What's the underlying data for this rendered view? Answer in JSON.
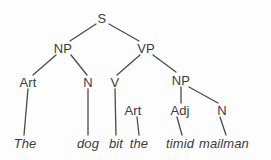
{
  "figure": {
    "kind": "syntax-parse-tree",
    "sentence": "The dog bit the timid mailman",
    "ink_color": "#3b3b3b",
    "background_color": "#fdfdfd",
    "edge_color": "#4a4a4a"
  },
  "nodes": [
    {
      "id": "S",
      "label": "S",
      "x": 102,
      "y": 18,
      "category": "nonterminal"
    },
    {
      "id": "NP1",
      "label": "NP",
      "x": 63,
      "y": 48,
      "category": "nonterminal"
    },
    {
      "id": "VP",
      "label": "VP",
      "x": 146,
      "y": 48,
      "category": "nonterminal"
    },
    {
      "id": "Art1",
      "label": "Art",
      "x": 28,
      "y": 82,
      "category": "preterminal"
    },
    {
      "id": "N1",
      "label": "N",
      "x": 88,
      "y": 82,
      "category": "preterminal"
    },
    {
      "id": "V",
      "label": "V",
      "x": 115,
      "y": 82,
      "category": "preterminal"
    },
    {
      "id": "NP2",
      "label": "NP",
      "x": 181,
      "y": 80,
      "category": "nonterminal"
    },
    {
      "id": "Art2",
      "label": "Art",
      "x": 133,
      "y": 110,
      "category": "preterminal"
    },
    {
      "id": "Adj",
      "label": "Adj",
      "x": 180,
      "y": 110,
      "category": "preterminal"
    },
    {
      "id": "N2",
      "label": "N",
      "x": 222,
      "y": 110,
      "category": "preterminal"
    }
  ],
  "terminals": [
    {
      "id": "t-the1",
      "label": "The",
      "x": 25,
      "y": 143,
      "parent": "Art1"
    },
    {
      "id": "t-dog",
      "label": "dog",
      "x": 88,
      "y": 143,
      "parent": "N1"
    },
    {
      "id": "t-bit",
      "label": "bit",
      "x": 116,
      "y": 143,
      "parent": "V"
    },
    {
      "id": "t-the2",
      "label": "the",
      "x": 139,
      "y": 143,
      "parent": "Art2"
    },
    {
      "id": "t-timid",
      "label": "timid",
      "x": 180,
      "y": 143,
      "parent": "Adj"
    },
    {
      "id": "t-mailman",
      "label": "mailman",
      "x": 224,
      "y": 143,
      "parent": "N2"
    }
  ],
  "edges": [
    {
      "id": "e-s-np1",
      "from": "S",
      "to": "NP1",
      "x1": 96,
      "y1": 24,
      "x2": 70,
      "y2": 41
    },
    {
      "id": "e-s-vp",
      "from": "S",
      "to": "VP",
      "x1": 109,
      "y1": 24,
      "x2": 139,
      "y2": 41
    },
    {
      "id": "e-np1-art1",
      "from": "NP1",
      "to": "Art1",
      "x1": 56,
      "y1": 55,
      "x2": 33,
      "y2": 75
    },
    {
      "id": "e-np1-n1",
      "from": "NP1",
      "to": "N1",
      "x1": 71,
      "y1": 55,
      "x2": 87,
      "y2": 75
    },
    {
      "id": "e-vp-v",
      "from": "VP",
      "to": "V",
      "x1": 140,
      "y1": 55,
      "x2": 117,
      "y2": 75
    },
    {
      "id": "e-vp-np2",
      "from": "VP",
      "to": "NP2",
      "x1": 153,
      "y1": 55,
      "x2": 176,
      "y2": 72
    },
    {
      "id": "e-v-bit",
      "from": "V",
      "to": "t-bit",
      "x1": 115,
      "y1": 89,
      "x2": 116,
      "y2": 135
    },
    {
      "id": "e-art2-the2",
      "from": "Art2",
      "to": "t-the2",
      "x1": 137,
      "y1": 117,
      "x2": 139,
      "y2": 135
    },
    {
      "id": "e-np2-adj",
      "from": "NP2",
      "to": "Adj",
      "x1": 181,
      "y1": 87,
      "x2": 181,
      "y2": 103
    },
    {
      "id": "e-np2-n2",
      "from": "NP2",
      "to": "N2",
      "x1": 189,
      "y1": 87,
      "x2": 218,
      "y2": 103
    },
    {
      "id": "e-art1-the1",
      "from": "Art1",
      "to": "t-the1",
      "x1": 28,
      "y1": 89,
      "x2": 24,
      "y2": 135
    },
    {
      "id": "e-n1-dog",
      "from": "N1",
      "to": "t-dog",
      "x1": 88,
      "y1": 89,
      "x2": 88,
      "y2": 135
    },
    {
      "id": "e-adj-timid",
      "from": "Adj",
      "to": "t-timid",
      "x1": 177,
      "y1": 117,
      "x2": 182,
      "y2": 135
    },
    {
      "id": "e-n2-mailman",
      "from": "N2",
      "to": "t-mailman",
      "x1": 220,
      "y1": 117,
      "x2": 226,
      "y2": 135
    }
  ]
}
